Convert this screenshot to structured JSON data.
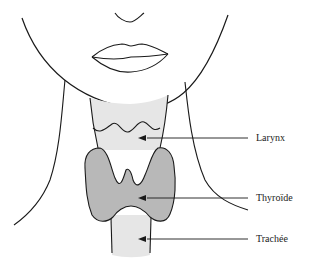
{
  "diagram": {
    "colors": {
      "outline": "#1a1a1a",
      "larynx_fill": "#e6e6e6",
      "thyroid_fill": "#b8b8b8",
      "trachea_fill": "#e6e6e6",
      "background": "#ffffff"
    },
    "labels": [
      {
        "id": "larynx",
        "text": "Larynx"
      },
      {
        "id": "thyroid",
        "text": "Thyroïde"
      },
      {
        "id": "trachea",
        "text": "Trachée"
      }
    ]
  }
}
